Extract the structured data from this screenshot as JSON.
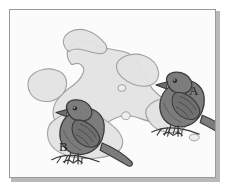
{
  "figure": {
    "kind": "island-map-illustration",
    "background_color": "#fbfbfb",
    "frame_border_color": "#9a9a9a",
    "frame_shadow_color": "#b9b9b9"
  },
  "map": {
    "land_fill_color": "#e3e3e3",
    "land_outline_color": "#9d9d9d",
    "islets_count": 3,
    "landmasses": [
      {
        "name": "large-central-island",
        "label": ""
      },
      {
        "name": "west-island",
        "label": ""
      },
      {
        "name": "north-central-island",
        "label": ""
      },
      {
        "name": "southwest-island",
        "label": ""
      },
      {
        "name": "east-island",
        "label": ""
      },
      {
        "name": "islet-upper",
        "label": ""
      },
      {
        "name": "islet-middle",
        "label": ""
      },
      {
        "name": "islet-lower-right",
        "label": ""
      }
    ]
  },
  "birds": [
    {
      "id": "bird-a",
      "label": "A",
      "body_color": "#7c7c7c",
      "outline_color": "#3a3a3a",
      "facing": "left",
      "position": "right"
    },
    {
      "id": "bird-b",
      "label": "B",
      "body_color": "#7c7c7c",
      "outline_color": "#3a3a3a",
      "facing": "left",
      "position": "left"
    }
  ],
  "labels": {
    "a": "A",
    "b": "B"
  }
}
